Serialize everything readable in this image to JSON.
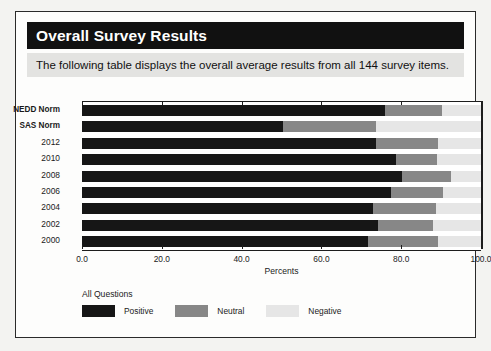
{
  "panel": {
    "title": "Overall Survey Results",
    "subtitle": "The following table displays the overall average results from all 144 survey items."
  },
  "legend": {
    "title": "All Questions",
    "items": [
      {
        "label": "Positive",
        "color": "#161616"
      },
      {
        "label": "Neutral",
        "color": "#878787"
      },
      {
        "label": "Negative",
        "color": "#e6e6e6"
      }
    ]
  },
  "chart_data": {
    "type": "bar",
    "orientation": "horizontal",
    "stacked": true,
    "stack_total": 100,
    "title": "Overall Survey Results",
    "xlabel": "Percents",
    "ylabel": "",
    "xlim": [
      0,
      100
    ],
    "xticks": [
      "0.0",
      "20.0",
      "40.0",
      "60.0",
      "80.0",
      "100.0"
    ],
    "xtick_values": [
      0,
      20,
      40,
      60,
      80,
      100
    ],
    "grid": false,
    "legend_position": "bottom-left",
    "categories": [
      "NEDD Norm",
      "SAS Norm",
      "2012",
      "2010",
      "2008",
      "2006",
      "2004",
      "2002",
      "2000"
    ],
    "series": [
      {
        "name": "Positive",
        "color": "#161616",
        "values": [
          76.0,
          50.4,
          73.7,
          78.7,
          80.2,
          77.4,
          73.0,
          74.2,
          71.7
        ]
      },
      {
        "name": "Neutral",
        "color": "#878787",
        "values": [
          14.3,
          23.3,
          15.5,
          10.3,
          12.3,
          13.2,
          15.8,
          13.8,
          17.5
        ]
      },
      {
        "name": "Negative",
        "color": "#e6e6e6",
        "values": [
          9.7,
          26.3,
          10.8,
          11.0,
          7.5,
          9.4,
          11.2,
          12.0,
          10.8
        ]
      }
    ],
    "bar_label_bold": [
      "NEDD Norm",
      "SAS Norm"
    ]
  }
}
